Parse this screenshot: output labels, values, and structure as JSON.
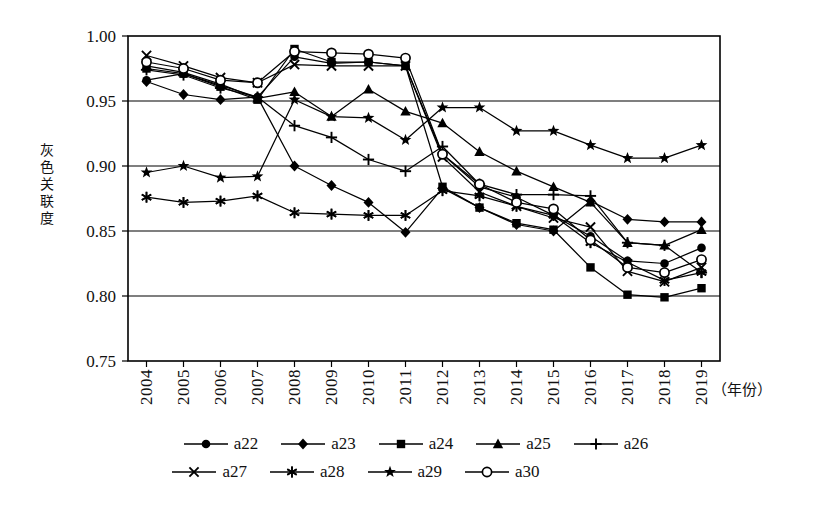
{
  "chart_data": {
    "type": "line",
    "title": "",
    "xlabel": "（年份）",
    "ylabel": "灰色关联度",
    "ylim": [
      0.75,
      1.0
    ],
    "yticks": [
      "0.75",
      "0.80",
      "0.85",
      "0.90",
      "0.95",
      "1.00"
    ],
    "grid": true,
    "legend_position": "bottom",
    "categories": [
      "2004",
      "2005",
      "2006",
      "2007",
      "2008",
      "2009",
      "2010",
      "2011",
      "2012",
      "2013",
      "2014",
      "2015",
      "2016",
      "2017",
      "2018",
      "2019"
    ],
    "series": [
      {
        "name": "a22",
        "marker": "filled-circle",
        "values": [
          0.966,
          0.971,
          0.962,
          0.953,
          0.984,
          0.979,
          0.98,
          0.977,
          0.909,
          0.884,
          0.876,
          0.862,
          0.846,
          0.827,
          0.825,
          0.837
        ]
      },
      {
        "name": "a23",
        "marker": "filled-diamond",
        "values": [
          0.965,
          0.955,
          0.951,
          0.953,
          0.9,
          0.885,
          0.872,
          0.849,
          0.883,
          0.868,
          0.855,
          0.85,
          0.873,
          0.859,
          0.857,
          0.857
        ]
      },
      {
        "name": "a24",
        "marker": "filled-square",
        "values": [
          0.975,
          0.971,
          0.961,
          0.951,
          0.99,
          0.98,
          0.98,
          0.977,
          0.884,
          0.868,
          0.856,
          0.851,
          0.822,
          0.801,
          0.799,
          0.806
        ]
      },
      {
        "name": "a25",
        "marker": "filled-triangle",
        "values": [
          0.977,
          0.972,
          0.963,
          0.952,
          0.957,
          0.938,
          0.959,
          0.942,
          0.933,
          0.911,
          0.896,
          0.884,
          0.872,
          0.841,
          0.839,
          0.851
        ]
      },
      {
        "name": "a26",
        "marker": "plus",
        "values": [
          0.974,
          0.97,
          0.96,
          0.953,
          0.931,
          0.922,
          0.905,
          0.896,
          0.915,
          0.886,
          0.878,
          0.878,
          0.877,
          0.841,
          0.839,
          0.818
        ]
      },
      {
        "name": "a27",
        "marker": "cross",
        "values": [
          0.985,
          0.977,
          0.968,
          0.964,
          0.978,
          0.977,
          0.977,
          0.977,
          0.907,
          0.88,
          0.869,
          0.86,
          0.853,
          0.819,
          0.811,
          0.822
        ]
      },
      {
        "name": "a28",
        "marker": "asterisk",
        "values": [
          0.876,
          0.872,
          0.873,
          0.877,
          0.864,
          0.863,
          0.862,
          0.862,
          0.881,
          0.877,
          0.869,
          0.862,
          0.841,
          0.826,
          0.812,
          0.818
        ]
      },
      {
        "name": "a29",
        "marker": "filled-star",
        "values": [
          0.895,
          0.9,
          0.891,
          0.892,
          0.951,
          0.938,
          0.937,
          0.92,
          0.945,
          0.945,
          0.927,
          0.927,
          0.916,
          0.906,
          0.906,
          0.916
        ]
      },
      {
        "name": "a30",
        "marker": "open-circle",
        "values": [
          0.98,
          0.975,
          0.966,
          0.964,
          0.988,
          0.987,
          0.986,
          0.983,
          0.909,
          0.886,
          0.872,
          0.867,
          0.843,
          0.822,
          0.818,
          0.828
        ]
      }
    ]
  },
  "axis": {
    "y_title_chars": [
      "灰",
      "色",
      "关",
      "联",
      "度"
    ],
    "y_ticks": [
      "1.00",
      "0.95",
      "0.90",
      "0.85",
      "0.80",
      "0.75"
    ],
    "x_ticks": [
      "2004",
      "2005",
      "2006",
      "2007",
      "2008",
      "2009",
      "2010",
      "2011",
      "2012",
      "2013",
      "2014",
      "2015",
      "2016",
      "2017",
      "2018",
      "2019"
    ],
    "x_title": "（年份）"
  },
  "legend": {
    "row1": [
      {
        "label": "a22",
        "marker": "filled-circle"
      },
      {
        "label": "a23",
        "marker": "filled-diamond"
      },
      {
        "label": "a24",
        "marker": "filled-square"
      },
      {
        "label": "a25",
        "marker": "filled-triangle"
      },
      {
        "label": "a26",
        "marker": "plus"
      }
    ],
    "row2": [
      {
        "label": "a27",
        "marker": "cross"
      },
      {
        "label": "a28",
        "marker": "asterisk"
      },
      {
        "label": "a29",
        "marker": "filled-star"
      },
      {
        "label": "a30",
        "marker": "open-circle"
      }
    ]
  },
  "colors": {
    "line": "#000000",
    "grid": "#000000",
    "frame": "#000000",
    "background": "#ffffff"
  }
}
